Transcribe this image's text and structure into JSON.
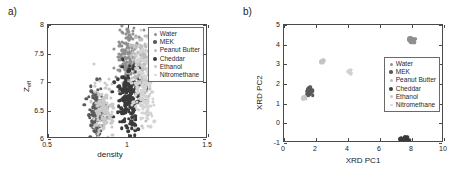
{
  "figure": {
    "background": "#ffffff",
    "axis_color": "#4a4a4a"
  },
  "series_legend": [
    {
      "label": "Water",
      "color": "#8f8f8f",
      "size": 1.6
    },
    {
      "label": "MEK",
      "color": "#5a5a5a",
      "size": 1.8
    },
    {
      "label": "Peanut Butter",
      "color": "#bdbdbd",
      "size": 1.5
    },
    {
      "label": "Cheddar",
      "color": "#3a3a3a",
      "size": 2.0
    },
    {
      "label": "Ethanol",
      "color": "#c9c9c9",
      "size": 1.5
    },
    {
      "label": "Nitromethane",
      "color": "#d8d8d8",
      "size": 1.4
    }
  ],
  "panel_a": {
    "panel_label": "a)",
    "legend_position": "top-right",
    "chart_data": {
      "type": "scatter",
      "title": "",
      "xlabel": "density",
      "ylabel_main": "Z",
      "ylabel_sub": "eff",
      "xlim": [
        0.5,
        1.5
      ],
      "ylim": [
        6,
        8
      ],
      "xticks": [
        0.5,
        1,
        1.5
      ],
      "xticklabels": [
        "0.5",
        "1",
        "1.5"
      ],
      "yticks": [
        6,
        6.5,
        7,
        7.5,
        8
      ],
      "yticklabels": [
        "6",
        "6.5",
        "7",
        "7.5",
        "8"
      ],
      "grid": false,
      "legend": [
        "Water",
        "MEK",
        "Peanut Butter",
        "Cheddar",
        "Ethanol",
        "Nitromethane"
      ],
      "clusters": [
        {
          "name": "Water",
          "color": "#8f8f8f",
          "x_center": 1.0,
          "y_center": 7.45,
          "x_spread": 0.035,
          "y_spread": 0.28,
          "n": 150,
          "size": 1.6
        },
        {
          "name": "MEK",
          "color": "#5a5a5a",
          "x_center": 0.805,
          "y_center": 6.47,
          "x_spread": 0.03,
          "y_spread": 0.24,
          "n": 120,
          "size": 1.7
        },
        {
          "name": "Peanut Butter",
          "color": "#bdbdbd",
          "x_center": 1.075,
          "y_center": 7.2,
          "x_spread": 0.04,
          "y_spread": 0.34,
          "n": 150,
          "size": 1.6
        },
        {
          "name": "Cheddar",
          "color": "#3a3a3a",
          "x_center": 1.0,
          "y_center": 6.72,
          "x_spread": 0.035,
          "y_spread": 0.27,
          "n": 170,
          "size": 1.8
        },
        {
          "name": "Ethanol",
          "color": "#c9c9c9",
          "x_center": 0.845,
          "y_center": 6.52,
          "x_spread": 0.033,
          "y_spread": 0.26,
          "n": 130,
          "size": 1.6
        },
        {
          "name": "Nitromethane",
          "color": "#d4d4d4",
          "x_center": 1.105,
          "y_center": 6.95,
          "x_spread": 0.038,
          "y_spread": 0.4,
          "n": 150,
          "size": 1.6
        }
      ]
    }
  },
  "panel_b": {
    "panel_label": "b)",
    "legend_position": "right-middle",
    "chart_data": {
      "type": "scatter",
      "title": "",
      "xlabel": "XRD PC1",
      "ylabel": "XRD PC2",
      "xlim": [
        0,
        10
      ],
      "ylim": [
        -1,
        5
      ],
      "xticks": [
        0,
        2,
        4,
        6,
        8,
        10
      ],
      "xticklabels": [
        "0",
        "2",
        "4",
        "6",
        "8",
        "10"
      ],
      "yticks": [
        -1,
        0,
        1,
        2,
        3,
        4,
        5
      ],
      "yticklabels": [
        "-1",
        "0",
        "1",
        "2",
        "3",
        "4",
        "5"
      ],
      "grid": false,
      "legend": [
        "Water",
        "MEK",
        "Peanut Butter",
        "Cheddar",
        "Ethanol",
        "Nitromethane"
      ],
      "clusters": [
        {
          "name": "Water",
          "color": "#8f8f8f",
          "x_center": 7.98,
          "y_center": 4.22,
          "x_spread": 0.1,
          "y_spread": 0.07,
          "n": 40,
          "size": 1.8
        },
        {
          "name": "MEK",
          "color": "#5a5a5a",
          "x_center": 1.58,
          "y_center": 1.66,
          "x_spread": 0.09,
          "y_spread": 0.09,
          "n": 35,
          "size": 1.8
        },
        {
          "name": "Peanut Butter",
          "color": "#c4c4c4",
          "x_center": 2.42,
          "y_center": 3.15,
          "x_spread": 0.06,
          "y_spread": 0.05,
          "n": 18,
          "size": 1.6
        },
        {
          "name": "Cheddar",
          "color": "#3a3a3a",
          "x_center": 7.52,
          "y_center": -0.85,
          "x_spread": 0.1,
          "y_spread": 0.07,
          "n": 38,
          "size": 1.8
        },
        {
          "name": "Ethanol",
          "color": "#c9c9c9",
          "x_center": 1.25,
          "y_center": 1.3,
          "x_spread": 0.06,
          "y_spread": 0.05,
          "n": 16,
          "size": 1.6
        },
        {
          "name": "Nitromethane",
          "color": "#d0d0d0",
          "x_center": 4.1,
          "y_center": 2.62,
          "x_spread": 0.06,
          "y_spread": 0.05,
          "n": 16,
          "size": 1.6
        }
      ]
    }
  }
}
